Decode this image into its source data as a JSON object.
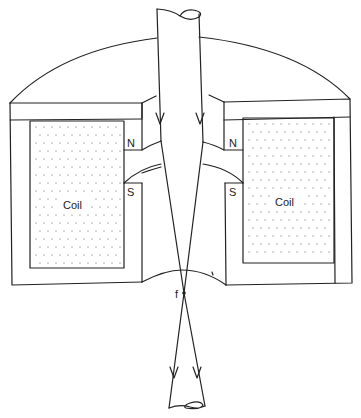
{
  "diagram": {
    "type": "magnetic-lens-cross-section",
    "labels": {
      "coil_left": "Coil",
      "coil_right": "Coil",
      "pole_north_left": "N",
      "pole_south_left": "S",
      "pole_north_right": "N",
      "pole_south_right": "S",
      "focal_point": "f"
    },
    "elements": [
      "iron-yoke-housing",
      "left-coil",
      "right-coil",
      "upper-pole-pieces",
      "lower-pole-pieces",
      "incoming-beam-tube",
      "outgoing-beam-tube",
      "electron-ray-left",
      "electron-ray-right",
      "focal-point"
    ],
    "colors": {
      "line": "#222222",
      "background": "#ffffff",
      "coil_dots": "#555555"
    }
  }
}
